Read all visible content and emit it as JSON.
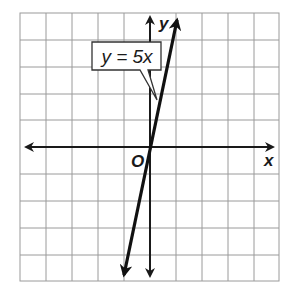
{
  "diagram": {
    "type": "coordinate-plane-graph",
    "grid": {
      "columns": 10,
      "rows": 10,
      "color": "#9a9a9a"
    },
    "axes": {
      "x_label": "x",
      "y_label": "y",
      "origin_label": "O",
      "color": "#1a1a1a"
    },
    "line": {
      "equation_label": "y = 5x",
      "slope": 5,
      "intercept": 0,
      "color": "#111111"
    }
  }
}
